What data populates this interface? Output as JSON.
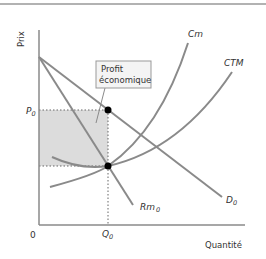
{
  "diagram": {
    "y_axis_label": "Prix",
    "x_axis_label": "Quantité",
    "origin_label": "0",
    "price_label": "P",
    "price_sub": "0",
    "quantity_label": "Q",
    "quantity_sub": "0",
    "curves": {
      "marginal_cost": "Cm",
      "average_total_cost": "CTM",
      "demand": "D",
      "demand_sub": "0",
      "marginal_revenue": "Rm",
      "marginal_revenue_sub": "0"
    },
    "callout": {
      "line1": "Profit",
      "line2": "économique"
    },
    "colors": {
      "curve": "#8a8a8a",
      "shade": "#d9d9d9",
      "point": "#000000",
      "axis": "#8a8a8a"
    }
  }
}
